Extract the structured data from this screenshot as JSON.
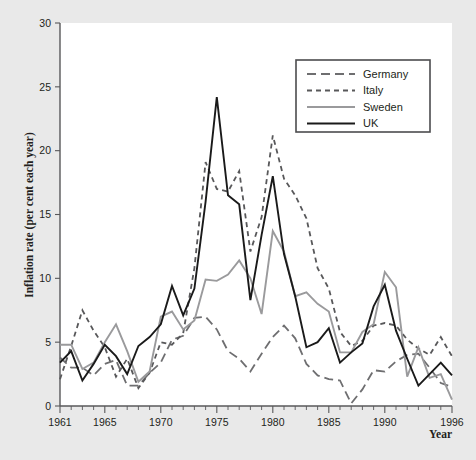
{
  "chart_data": {
    "type": "line",
    "title": "",
    "xlabel": "Year",
    "ylabel": "Inflation rate (per cent each year)",
    "xlim": [
      1961,
      1996
    ],
    "ylim": [
      0,
      30
    ],
    "ytick_step": 5,
    "grid": false,
    "legend_position": "top-right",
    "x_tick_labels": [
      "1961",
      "1965",
      "1970",
      "1975",
      "1980",
      "1985",
      "1990",
      "1996"
    ],
    "x_tick_values": [
      1961,
      1965,
      1970,
      1975,
      1980,
      1985,
      1990,
      1996
    ],
    "y_tick_labels": [
      "0",
      "5",
      "10",
      "15",
      "20",
      "25",
      "30"
    ],
    "y_tick_values": [
      0,
      5,
      10,
      15,
      20,
      25,
      30
    ],
    "x": [
      1961,
      1962,
      1963,
      1964,
      1965,
      1966,
      1967,
      1968,
      1969,
      1970,
      1971,
      1972,
      1973,
      1974,
      1975,
      1976,
      1977,
      1978,
      1979,
      1980,
      1981,
      1982,
      1983,
      1984,
      1985,
      1986,
      1987,
      1988,
      1989,
      1990,
      1991,
      1992,
      1993,
      1994,
      1995,
      1996
    ],
    "series": [
      {
        "name": "Germany",
        "style": "long-dash",
        "color": "#6e6e70",
        "values": [
          3.8,
          3.0,
          3.0,
          2.4,
          3.3,
          3.6,
          1.6,
          1.6,
          2.6,
          3.4,
          5.2,
          5.5,
          6.9,
          7.0,
          6.0,
          4.3,
          3.7,
          2.7,
          4.1,
          5.4,
          6.3,
          5.3,
          3.3,
          2.4,
          2.1,
          2.0,
          0.2,
          1.3,
          2.8,
          2.7,
          3.5,
          4.0,
          4.1,
          3.0,
          1.8,
          1.5
        ],
        "values_note": "long-dashed grey line, lowest overall"
      },
      {
        "name": "Italy",
        "style": "short-dash",
        "color": "#58585a",
        "values": [
          2.1,
          4.7,
          7.5,
          5.9,
          4.6,
          2.3,
          3.7,
          1.4,
          2.6,
          5.0,
          4.8,
          5.7,
          10.8,
          19.1,
          17.0,
          16.8,
          18.4,
          12.1,
          14.8,
          21.2,
          17.8,
          16.5,
          14.7,
          10.8,
          9.2,
          5.8,
          4.7,
          5.1,
          6.3,
          6.5,
          6.3,
          5.2,
          4.5,
          4.0,
          5.4,
          3.9
        ],
        "values_note": "short-dashed dark grey line, highest in 1980"
      },
      {
        "name": "Sweden",
        "style": "solid",
        "color": "#9a9a9c",
        "values": [
          4.8,
          4.8,
          2.9,
          3.4,
          5.0,
          6.4,
          4.3,
          1.9,
          2.7,
          7.0,
          7.4,
          6.0,
          6.7,
          9.9,
          9.8,
          10.3,
          11.4,
          10.0,
          7.2,
          13.7,
          12.1,
          8.6,
          8.9,
          8.0,
          7.4,
          4.2,
          4.2,
          5.8,
          6.4,
          10.5,
          9.3,
          2.3,
          4.6,
          2.2,
          2.5,
          0.5
        ],
        "values_note": "solid light grey line"
      },
      {
        "name": "UK",
        "style": "solid",
        "color": "#1a1a1a",
        "values": [
          3.4,
          4.3,
          2.0,
          3.3,
          4.8,
          3.9,
          2.5,
          4.7,
          5.4,
          6.4,
          9.4,
          7.1,
          9.2,
          16.0,
          24.2,
          16.5,
          15.8,
          8.3,
          13.4,
          18.0,
          11.9,
          8.6,
          4.6,
          5.0,
          6.1,
          3.4,
          4.2,
          4.9,
          7.8,
          9.5,
          5.9,
          3.7,
          1.6,
          2.5,
          3.4,
          2.4
        ],
        "values_note": "solid black line, peak 1975"
      }
    ]
  },
  "legend": {
    "items": [
      {
        "label": "Germany"
      },
      {
        "label": "Italy"
      },
      {
        "label": "Sweden"
      },
      {
        "label": "UK"
      }
    ]
  }
}
